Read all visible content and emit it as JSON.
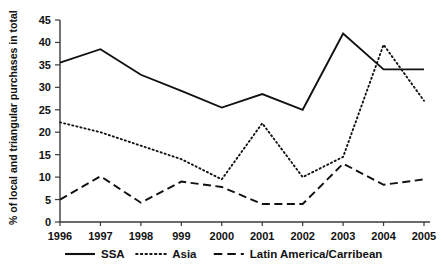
{
  "chart_data": {
    "type": "line",
    "title": "",
    "xlabel": "",
    "ylabel": "% of local and triangular purchases in total",
    "categories": [
      "1996",
      "1997",
      "1998",
      "999",
      "2000",
      "2001",
      "2002",
      "2003",
      "2004",
      "2005"
    ],
    "xtick_labels": [
      "1996",
      "1997",
      "1998",
      "999",
      "2000",
      "2001",
      "2002",
      "2003",
      "2004",
      "2005"
    ],
    "ytick_labels": [
      "0",
      "5",
      "10",
      "15",
      "20",
      "25",
      "30",
      "35",
      "40",
      "45"
    ],
    "ytick_values": [
      0,
      5,
      10,
      15,
      20,
      25,
      30,
      35,
      40,
      45
    ],
    "ylim": [
      0,
      45
    ],
    "grid": false,
    "legend_position": "bottom",
    "series": [
      {
        "name": "SSA",
        "style": "solid",
        "values": [
          35.5,
          38.5,
          32.8,
          29.2,
          25.5,
          28.5,
          25.0,
          42.0,
          34.0,
          34.0
        ]
      },
      {
        "name": "Asia",
        "style": "dotted",
        "values": [
          22.2,
          20.0,
          17.0,
          14.0,
          9.5,
          22.0,
          10.0,
          14.5,
          39.5,
          27.0
        ]
      },
      {
        "name": "Latin America/Carribean",
        "style": "dashed",
        "values": [
          5.0,
          10.2,
          4.3,
          9.0,
          7.8,
          4.0,
          4.0,
          13.0,
          8.3,
          9.5
        ]
      }
    ]
  },
  "axis": {
    "y_title": "% of local and triangular purchases in total"
  },
  "legend": {
    "items": [
      {
        "label": "SSA",
        "style": "solid"
      },
      {
        "label": "Asia",
        "style": "dotted"
      },
      {
        "label": "Latin America/Carribean",
        "style": "dashed"
      }
    ]
  }
}
